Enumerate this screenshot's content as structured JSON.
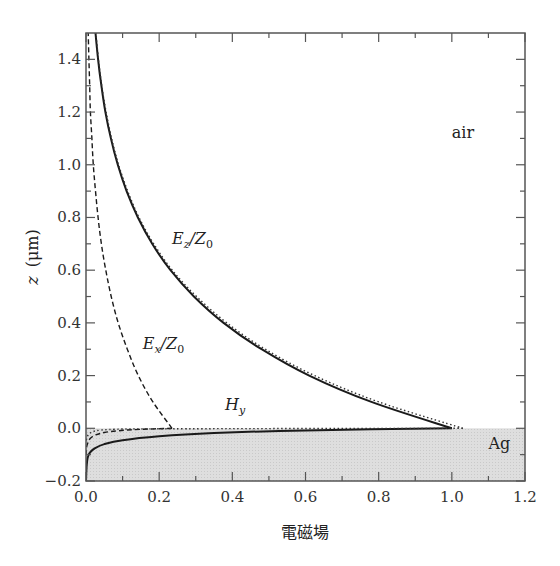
{
  "chart_data": {
    "type": "line",
    "title": "",
    "xlabel": "電磁場",
    "ylabel": "z (μm)",
    "ylabel_var": "z",
    "ylabel_unit": "(μm)",
    "xlim": [
      0.0,
      1.2
    ],
    "ylim": [
      -0.2,
      1.5
    ],
    "grid": false,
    "legend": "none (inline labels)",
    "x_ticks": [
      0.0,
      0.2,
      0.4,
      0.6,
      0.8,
      1.0,
      1.2
    ],
    "x_tick_labels": [
      "0.0",
      "0.2",
      "0.4",
      "0.6",
      "0.8",
      "1.0",
      "1.2"
    ],
    "x_minor_ticks": [
      0.1,
      0.3,
      0.5,
      0.7,
      0.9,
      1.1
    ],
    "y_ticks": [
      -0.2,
      0.0,
      0.2,
      0.4,
      0.6,
      0.8,
      1.0,
      1.2,
      1.4
    ],
    "y_tick_labels": [
      "−0.2",
      "0.0",
      "0.2",
      "0.4",
      "0.6",
      "0.8",
      "1.0",
      "1.2",
      "1.4"
    ],
    "y_minor_ticks": [
      -0.1,
      0.1,
      0.3,
      0.5,
      0.7,
      0.9,
      1.1,
      1.3
    ],
    "regions": [
      {
        "name": "air",
        "label": "air",
        "z_range": [
          0.0,
          1.5
        ],
        "color": "#ffffff"
      },
      {
        "name": "Ag",
        "label": "Ag",
        "z_range": [
          -0.2,
          0.0
        ],
        "color": "#dcdcdc"
      }
    ],
    "series": [
      {
        "name": "E_z/Z_0",
        "style": "solid",
        "color": "#1a1a1a",
        "points_air": [
          [
            1.0,
            0.0
          ],
          [
            0.78,
            0.1
          ],
          [
            0.61,
            0.2
          ],
          [
            0.48,
            0.3
          ],
          [
            0.376,
            0.4
          ],
          [
            0.295,
            0.5
          ],
          [
            0.231,
            0.6
          ],
          [
            0.181,
            0.7
          ],
          [
            0.142,
            0.8
          ],
          [
            0.111,
            0.9
          ],
          [
            0.087,
            1.0
          ],
          [
            0.068,
            1.1
          ],
          [
            0.053,
            1.2
          ],
          [
            0.042,
            1.3
          ],
          [
            0.033,
            1.4
          ],
          [
            0.026,
            1.5
          ]
        ],
        "points_metal": [
          [
            1.0,
            0.0
          ],
          [
            0.6,
            -0.008
          ],
          [
            0.35,
            -0.018
          ],
          [
            0.2,
            -0.03
          ],
          [
            0.1,
            -0.045
          ],
          [
            0.05,
            -0.06
          ],
          [
            0.025,
            -0.075
          ],
          [
            0.012,
            -0.09
          ],
          [
            0.006,
            -0.105
          ],
          [
            0.003,
            -0.125
          ],
          [
            0.001,
            -0.16
          ],
          [
            0.0,
            -0.2
          ]
        ]
      },
      {
        "name": "E_x/Z_0",
        "style": "dashed",
        "color": "#1a1a1a",
        "points_air": [
          [
            0.235,
            0.0
          ],
          [
            0.183,
            0.1
          ],
          [
            0.143,
            0.2
          ],
          [
            0.113,
            0.3
          ],
          [
            0.088,
            0.4
          ],
          [
            0.069,
            0.5
          ],
          [
            0.054,
            0.6
          ],
          [
            0.042,
            0.7
          ],
          [
            0.033,
            0.8
          ],
          [
            0.026,
            0.9
          ],
          [
            0.02,
            1.0
          ],
          [
            0.016,
            1.1
          ],
          [
            0.012,
            1.2
          ],
          [
            0.01,
            1.3
          ],
          [
            0.008,
            1.4
          ],
          [
            0.006,
            1.5
          ]
        ],
        "points_metal": [
          [
            0.235,
            0.0
          ],
          [
            0.15,
            -0.004
          ],
          [
            0.09,
            -0.009
          ],
          [
            0.05,
            -0.016
          ],
          [
            0.025,
            -0.026
          ],
          [
            0.012,
            -0.038
          ],
          [
            0.006,
            -0.052
          ],
          [
            0.002,
            -0.07
          ],
          [
            0.0,
            -0.1
          ]
        ]
      },
      {
        "name": "H_y",
        "style": "dotted",
        "color": "#333333",
        "points_air": [
          [
            1.03,
            0.0
          ],
          [
            0.8,
            0.1
          ],
          [
            0.625,
            0.2
          ],
          [
            0.49,
            0.3
          ],
          [
            0.385,
            0.4
          ],
          [
            0.302,
            0.5
          ],
          [
            0.236,
            0.6
          ],
          [
            0.185,
            0.7
          ],
          [
            0.145,
            0.8
          ],
          [
            0.114,
            0.9
          ],
          [
            0.089,
            1.0
          ],
          [
            0.07,
            1.1
          ],
          [
            0.055,
            1.2
          ],
          [
            0.043,
            1.3
          ],
          [
            0.034,
            1.4
          ],
          [
            0.027,
            1.5
          ]
        ],
        "points_metal": [
          [
            1.03,
            0.0
          ],
          [
            0.2,
            -0.002
          ],
          [
            0.08,
            -0.004
          ],
          [
            0.04,
            -0.007
          ],
          [
            0.02,
            -0.012
          ],
          [
            0.01,
            -0.02
          ],
          [
            0.004,
            -0.03
          ],
          [
            0.0,
            -0.05
          ]
        ]
      }
    ],
    "annotations": [
      {
        "main": "E",
        "sub": "z",
        "tail": "/Z",
        "tail_sub": "0",
        "x": 0.235,
        "z": 0.7
      },
      {
        "main": "E",
        "sub": "x",
        "tail": "/Z",
        "tail_sub": "0",
        "x": 0.155,
        "z": 0.3
      },
      {
        "main": "H",
        "sub": "y",
        "tail": "",
        "tail_sub": "",
        "x": 0.38,
        "z": 0.07
      },
      {
        "main": "air",
        "sub": "",
        "tail": "",
        "tail_sub": "",
        "x": 1.0,
        "z": 1.1
      },
      {
        "main": "Ag",
        "sub": "",
        "tail": "",
        "tail_sub": "",
        "x": 1.1,
        "z": -0.08
      }
    ]
  }
}
